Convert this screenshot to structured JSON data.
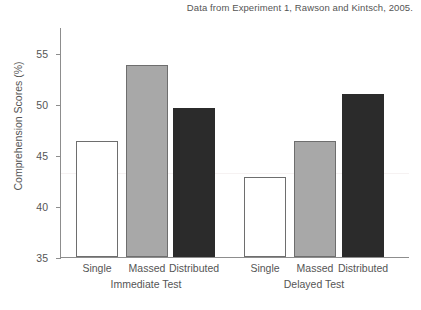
{
  "caption": "Data from Experiment 1, Rawson and Kintsch, 2005.",
  "chart_data": {
    "type": "bar",
    "title": "",
    "subtitle": "Data from Experiment 1, Rawson and Kintsch, 2005.",
    "xlabel": "",
    "ylabel": "Comprehension Scores (%)",
    "ylim": [
      32,
      56.5
    ],
    "yticks": [
      35,
      40,
      45,
      50,
      55
    ],
    "ytick_labels": [
      "35",
      "40",
      "45",
      "50",
      "55"
    ],
    "grid": false,
    "legend": "none",
    "categories": [
      "Single",
      "Massed",
      "Distributed"
    ],
    "groups": [
      {
        "name": "Immediate Test",
        "bars": [
          {
            "label": "Single",
            "value": 44.4,
            "fill": "white"
          },
          {
            "label": "Massed",
            "value": 52.5,
            "fill": "gray"
          },
          {
            "label": "Distributed",
            "value": 47.9,
            "fill": "black"
          }
        ]
      },
      {
        "name": "Delayed Test",
        "bars": [
          {
            "label": "Single",
            "value": 40.5,
            "fill": "white"
          },
          {
            "label": "Massed",
            "value": 44.4,
            "fill": "gray"
          },
          {
            "label": "Distributed",
            "value": 49.4,
            "fill": "black"
          }
        ]
      }
    ],
    "colors": {
      "single": "#ffffff",
      "massed": "#a8a8a8",
      "distributed": "#2b2b2b",
      "axis": "#8d8d8d",
      "text": "#555555"
    }
  },
  "axis": {
    "y_title": "Comprehension Scores (%)",
    "tick_0": "35",
    "tick_1": "40",
    "tick_2": "45",
    "tick_3": "50",
    "tick_4": "55"
  },
  "x_axis": {
    "g0_b0": "Single",
    "g0_b1": "Massed",
    "g0_b2": "Distributed",
    "g0_name": "Immediate Test",
    "g1_b0": "Single",
    "g1_b1": "Massed",
    "g1_b2": "Distributed",
    "g1_name": "Delayed Test"
  }
}
